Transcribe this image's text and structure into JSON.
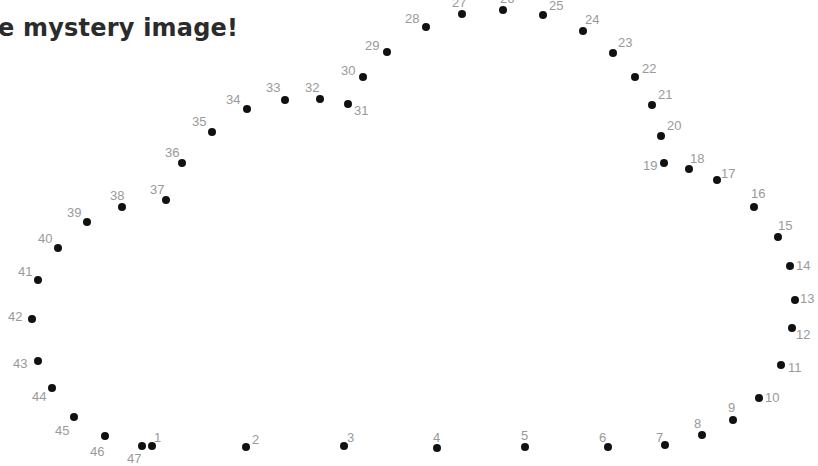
{
  "title": "e mystery image!",
  "colors": {
    "dot": "#111111",
    "label": "#9a9a9a",
    "title": "#2b2b2b",
    "background": "#ffffff"
  },
  "dots": [
    {
      "n": "1",
      "x": 152,
      "y": 446,
      "lx": 154,
      "ly": 431
    },
    {
      "n": "2",
      "x": 246,
      "y": 447,
      "lx": 252,
      "ly": 433
    },
    {
      "n": "3",
      "x": 344,
      "y": 446,
      "lx": 347,
      "ly": 431
    },
    {
      "n": "4",
      "x": 437,
      "y": 448,
      "lx": 433,
      "ly": 431
    },
    {
      "n": "5",
      "x": 525,
      "y": 447,
      "lx": 521,
      "ly": 429
    },
    {
      "n": "6",
      "x": 608,
      "y": 447,
      "lx": 599,
      "ly": 431
    },
    {
      "n": "7",
      "x": 665,
      "y": 445,
      "lx": 656,
      "ly": 431
    },
    {
      "n": "8",
      "x": 702,
      "y": 435,
      "lx": 694,
      "ly": 417
    },
    {
      "n": "9",
      "x": 733,
      "y": 420,
      "lx": 728,
      "ly": 401
    },
    {
      "n": "10",
      "x": 759,
      "y": 398,
      "lx": 765,
      "ly": 391
    },
    {
      "n": "11",
      "x": 781,
      "y": 365,
      "lx": 788,
      "ly": 361
    },
    {
      "n": "12",
      "x": 792,
      "y": 328,
      "lx": 796,
      "ly": 328
    },
    {
      "n": "13",
      "x": 795,
      "y": 300,
      "lx": 800,
      "ly": 292
    },
    {
      "n": "14",
      "x": 790,
      "y": 266,
      "lx": 796,
      "ly": 259
    },
    {
      "n": "15",
      "x": 778,
      "y": 237,
      "lx": 778,
      "ly": 219
    },
    {
      "n": "16",
      "x": 754,
      "y": 207,
      "lx": 751,
      "ly": 187
    },
    {
      "n": "17",
      "x": 717,
      "y": 180,
      "lx": 721,
      "ly": 167
    },
    {
      "n": "18",
      "x": 689,
      "y": 169,
      "lx": 690,
      "ly": 152
    },
    {
      "n": "19",
      "x": 664,
      "y": 163,
      "lx": 643,
      "ly": 159
    },
    {
      "n": "20",
      "x": 661,
      "y": 136,
      "lx": 667,
      "ly": 119
    },
    {
      "n": "21",
      "x": 652,
      "y": 105,
      "lx": 658,
      "ly": 88
    },
    {
      "n": "22",
      "x": 635,
      "y": 77,
      "lx": 642,
      "ly": 62
    },
    {
      "n": "23",
      "x": 613,
      "y": 53,
      "lx": 618,
      "ly": 36
    },
    {
      "n": "24",
      "x": 583,
      "y": 31,
      "lx": 585,
      "ly": 13
    },
    {
      "n": "25",
      "x": 543,
      "y": 15,
      "lx": 549,
      "ly": -1
    },
    {
      "n": "26",
      "x": 503,
      "y": 10,
      "lx": 500,
      "ly": -8
    },
    {
      "n": "27",
      "x": 462,
      "y": 14,
      "lx": 452,
      "ly": -4
    },
    {
      "n": "28",
      "x": 426,
      "y": 27,
      "lx": 405,
      "ly": 12
    },
    {
      "n": "29",
      "x": 387,
      "y": 52,
      "lx": 365,
      "ly": 39
    },
    {
      "n": "30",
      "x": 363,
      "y": 77,
      "lx": 341,
      "ly": 64
    },
    {
      "n": "31",
      "x": 348,
      "y": 104,
      "lx": 354,
      "ly": 104
    },
    {
      "n": "32",
      "x": 320,
      "y": 99,
      "lx": 305,
      "ly": 81
    },
    {
      "n": "33",
      "x": 285,
      "y": 100,
      "lx": 266,
      "ly": 81
    },
    {
      "n": "34",
      "x": 247,
      "y": 109,
      "lx": 226,
      "ly": 93
    },
    {
      "n": "35",
      "x": 212,
      "y": 132,
      "lx": 192,
      "ly": 115
    },
    {
      "n": "36",
      "x": 182,
      "y": 163,
      "lx": 165,
      "ly": 146
    },
    {
      "n": "37",
      "x": 166,
      "y": 200,
      "lx": 150,
      "ly": 183
    },
    {
      "n": "38",
      "x": 122,
      "y": 207,
      "lx": 110,
      "ly": 189
    },
    {
      "n": "39",
      "x": 87,
      "y": 222,
      "lx": 67,
      "ly": 206
    },
    {
      "n": "40",
      "x": 58,
      "y": 248,
      "lx": 38,
      "ly": 232
    },
    {
      "n": "41",
      "x": 38,
      "y": 280,
      "lx": 18,
      "ly": 265
    },
    {
      "n": "42",
      "x": 32,
      "y": 319,
      "lx": 8,
      "ly": 310
    },
    {
      "n": "43",
      "x": 38,
      "y": 361,
      "lx": 13,
      "ly": 357
    },
    {
      "n": "44",
      "x": 52,
      "y": 388,
      "lx": 32,
      "ly": 390
    },
    {
      "n": "45",
      "x": 74,
      "y": 417,
      "lx": 55,
      "ly": 424
    },
    {
      "n": "46",
      "x": 105,
      "y": 436,
      "lx": 90,
      "ly": 445
    },
    {
      "n": "47",
      "x": 142,
      "y": 446,
      "lx": 127,
      "ly": 452
    }
  ]
}
